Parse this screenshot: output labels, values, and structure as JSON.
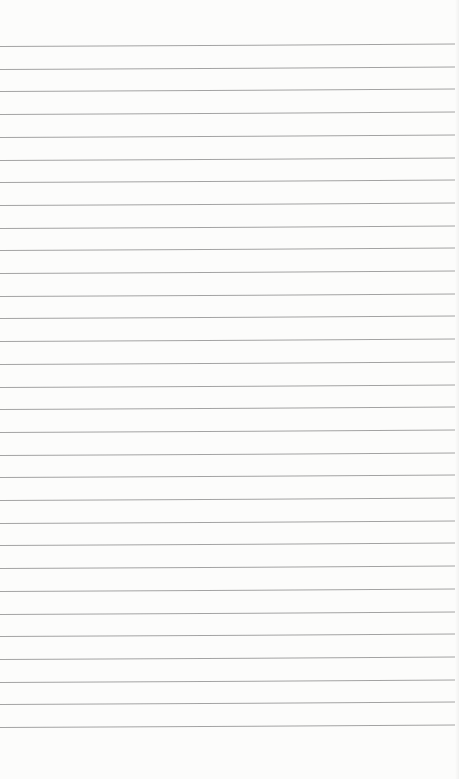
{
  "page": {
    "type": "lined-notepad-paper",
    "content_text": "",
    "background_color": "#fcfcfb",
    "line_color": "#a3a3a3"
  },
  "ruled_lines": {
    "count": 31,
    "first_y": 46,
    "spacing": 22.7
  }
}
